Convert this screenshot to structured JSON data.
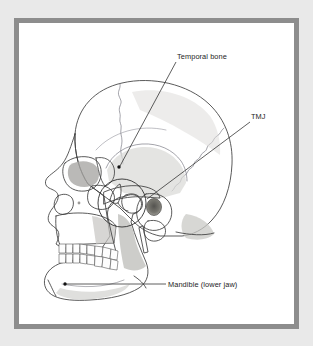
{
  "figure": {
    "frame": {
      "outer_background_color": "#e9e9e9",
      "border_color": "#8d8d8d",
      "panel_color": "#ffffff",
      "border_width_px": 5
    },
    "palette": {
      "outline_stroke": "#3d3d3d",
      "suture_stroke": "#7d7d86",
      "bone_light": "#e4e3e1",
      "bone_mid": "#d2d1cf",
      "bone_shadow": "#b8b7b5",
      "bone_deep_shadow": "#9a9997",
      "tooth_fill": "#fdfdfd",
      "ear_canal_dark": "#5e5d5c",
      "label_text": "#1d1d1d",
      "leader_line": "#2a2a2a"
    }
  },
  "labels": [
    {
      "id": "temporal-bone",
      "text": "Temporal bone",
      "text_x": 177,
      "text_y": 59,
      "anchor": "start",
      "leader_path": "M 176 62 L 120 166",
      "dot_x": 119,
      "dot_y": 167,
      "points_to": "squamous portion of the temporal bone on the side of the cranium"
    },
    {
      "id": "tmj",
      "text": "TMJ",
      "text_x": 251,
      "text_y": 119,
      "anchor": "start",
      "leader_path": "M 250 122 L 147 199",
      "dot_x": null,
      "dot_y": null,
      "points_to": "temporomandibular joint, circled at the mandibular condyle and glenoid fossa"
    },
    {
      "id": "mandible",
      "text": "Mandible (lower jaw)",
      "text_x": 168,
      "text_y": 287,
      "anchor": "start",
      "leader_path": "M 166 284 L 66 284",
      "dot_x": 65,
      "dot_y": 284,
      "points_to": "body of the mandible near the chin"
    }
  ],
  "annotations": {
    "tmj_highlight_circle": {
      "center_x": 122,
      "center_y": 203,
      "radius": 24
    }
  },
  "anatomy_parts": [
    "cranial vault",
    "frontal bone",
    "coronal suture",
    "parietal bone",
    "lambdoid suture",
    "occipital bone",
    "temporal bone squama",
    "external auditory meatus",
    "mastoid process",
    "styloid process",
    "zygomatic arch",
    "orbit",
    "nasal aperture",
    "maxilla",
    "upper teeth",
    "lower teeth",
    "mandibular condyle",
    "coronoid process",
    "mandibular ramus",
    "mandibular body",
    "mental protuberance"
  ]
}
